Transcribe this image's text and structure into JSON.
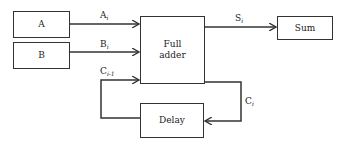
{
  "diagram": {
    "title": "",
    "blocks": {
      "a": {
        "label": "A"
      },
      "b": {
        "label": "B"
      },
      "full_adder": {
        "label_line1": "Full",
        "label_line2": "adder"
      },
      "sum": {
        "label": "Sum"
      },
      "delay": {
        "label": "Delay"
      }
    },
    "signals": {
      "a_i": {
        "base": "A",
        "sub": "i"
      },
      "b_i": {
        "base": "B",
        "sub": "i"
      },
      "s_i": {
        "base": "S",
        "sub": "i"
      },
      "c_prev": {
        "base": "C",
        "sub": "i-1"
      },
      "c_i": {
        "base": "C",
        "sub": "i"
      }
    },
    "edges": [
      {
        "from": "A",
        "to": "Full adder",
        "label": "Ai"
      },
      {
        "from": "B",
        "to": "Full adder",
        "label": "Bi"
      },
      {
        "from": "Full adder",
        "to": "Sum",
        "label": "Si"
      },
      {
        "from": "Full adder",
        "to": "Delay",
        "label": "Ci"
      },
      {
        "from": "Delay",
        "to": "Full adder",
        "label": "Ci-1"
      }
    ],
    "colors": {
      "line": "#333333",
      "background": "#ffffff"
    }
  }
}
